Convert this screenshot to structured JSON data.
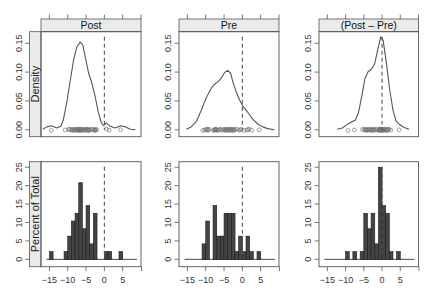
{
  "figure": {
    "width": 431,
    "height": 295,
    "colors": {
      "curve": "#555555",
      "rug": "#777777",
      "bar_fill": "#454545",
      "bar_stroke": "#1a1a1a",
      "strip_bg": "#ebebeb",
      "frame": "#555555",
      "reference_line": "#555555"
    },
    "columns": [
      {
        "x0": 41,
        "x1": 141,
        "zero_px": 104
      },
      {
        "x0": 179,
        "x1": 279,
        "zero_px": 242.5
      },
      {
        "x0": 319,
        "x1": 418.5,
        "zero_px": 382
      }
    ],
    "rows": {
      "density": {
        "strip_y0": 19,
        "y0": 31.7,
        "y1": 136.7
      },
      "histogram": {
        "y0": 161.7,
        "y1": 266.7
      }
    },
    "row_strips": {
      "density": "Density",
      "histogram": "Percent of Total"
    }
  },
  "chart_data": [
    {
      "type": "line",
      "panel": "Post",
      "row": "density",
      "title": "Post",
      "ylabel": "Density",
      "xlim": [
        -17.3,
        10.0
      ],
      "ylim": [
        -0.012,
        0.17
      ],
      "xticks": [
        -15,
        -10,
        -5,
        0,
        5,
        10
      ],
      "xtick_labels": [],
      "yticks": [
        0.0,
        0.05,
        0.1,
        0.15
      ],
      "ytick_labels": [
        "0.00",
        "0.05",
        "0.10",
        "0.15"
      ],
      "reference_line_x": 0,
      "grid": false,
      "curve": {
        "x": [
          -16.8,
          -15.7,
          -14.4,
          -13.0,
          -11.9,
          -11.2,
          -10.3,
          -9.3,
          -8.4,
          -7.5,
          -6.6,
          -5.9,
          -5.2,
          -4.3,
          -3.4,
          -2.5,
          -1.6,
          -0.8,
          -0.2,
          0.5,
          1.6,
          3.0,
          4.4,
          5.8,
          7.1,
          8.5
        ],
        "y": [
          0.001,
          0.005,
          0.007,
          0.003,
          0.006,
          0.017,
          0.046,
          0.086,
          0.121,
          0.144,
          0.152,
          0.147,
          0.126,
          0.098,
          0.081,
          0.057,
          0.029,
          0.012,
          0.007,
          0.012,
          0.006,
          0.003,
          0.007,
          0.005,
          0.001,
          0.0
        ]
      },
      "points": [
        -14.5,
        -10.7,
        -9.8,
        -9.5,
        -9.2,
        -8.9,
        -8.7,
        -8.5,
        -8.3,
        -8.1,
        -7.9,
        -7.7,
        -7.5,
        -7.4,
        -7.2,
        -7.1,
        -6.95,
        -6.9,
        -6.8,
        -6.7,
        -6.6,
        -6.5,
        -6.4,
        -6.3,
        -6.2,
        -6.1,
        -5.8,
        -5.6,
        -5.4,
        -5.2,
        -4.9,
        -4.8,
        -4.6,
        -4.5,
        -4.3,
        -4.2,
        -4.1,
        -3.7,
        -3.3,
        -2.9,
        -2.8,
        -2.6,
        -2.5,
        -2.3,
        -2.1,
        0.6,
        1.3,
        4.4
      ]
    },
    {
      "type": "line",
      "panel": "Pre",
      "row": "density",
      "title": "Pre",
      "ylabel": "",
      "xlim": [
        -17.3,
        10.0
      ],
      "ylim": [
        -0.012,
        0.17
      ],
      "xticks": [
        -15,
        -10,
        -5,
        0,
        5,
        10
      ],
      "xtick_labels": [],
      "yticks": [
        0.0,
        0.05,
        0.1,
        0.15
      ],
      "ytick_labels": [
        "0.00",
        "0.05",
        "0.10",
        "0.15"
      ],
      "reference_line_x": 0,
      "grid": false,
      "curve": {
        "x": [
          -15.3,
          -14.0,
          -12.6,
          -11.2,
          -9.9,
          -8.5,
          -7.6,
          -6.7,
          -5.8,
          -4.9,
          -4.0,
          -3.2,
          -2.6,
          -1.7,
          -0.8,
          0.1,
          1.5,
          2.9,
          4.2,
          5.6,
          6.9,
          8.8
        ],
        "y": [
          0.001,
          0.005,
          0.014,
          0.034,
          0.055,
          0.072,
          0.079,
          0.083,
          0.089,
          0.099,
          0.103,
          0.098,
          0.083,
          0.066,
          0.052,
          0.041,
          0.03,
          0.018,
          0.01,
          0.005,
          0.002,
          0.0
        ]
      },
      "points": [
        -10.8,
        -10.3,
        -9.9,
        -9.7,
        -9.5,
        -9.3,
        -9.1,
        -7.9,
        -7.7,
        -7.5,
        -7.4,
        -7.3,
        -7.2,
        -7.1,
        -6.8,
        -6.5,
        -6.2,
        -5.9,
        -5.5,
        -5.1,
        -4.9,
        -4.7,
        -4.5,
        -4.4,
        -4.2,
        -4.1,
        -3.9,
        -3.7,
        -3.5,
        -3.4,
        -3.2,
        -3.1,
        -2.9,
        -2.7,
        -2.5,
        -2.4,
        -2.2,
        -2.1,
        -1.5,
        -0.9,
        -0.6,
        -0.3,
        0.4,
        1.2,
        1.5,
        1.8,
        2.5,
        4.6
      ]
    },
    {
      "type": "line",
      "panel": "(Post - Pre)",
      "row": "density",
      "title": "(Post – Pre)",
      "ylabel": "",
      "xlim": [
        -17.3,
        10.0
      ],
      "ylim": [
        -0.012,
        0.17
      ],
      "xticks": [
        -15,
        -10,
        -5,
        0,
        5,
        10
      ],
      "xtick_labels": [],
      "yticks": [
        0.0,
        0.05,
        0.1,
        0.15
      ],
      "ytick_labels": [
        "0.00",
        "0.05",
        "0.10",
        "0.15"
      ],
      "reference_line_x": 0,
      "grid": false,
      "curve": {
        "x": [
          -12.3,
          -10.9,
          -9.6,
          -8.2,
          -7.3,
          -6.5,
          -5.6,
          -4.7,
          -3.8,
          -2.9,
          -2.0,
          -1.1,
          -0.35,
          0.3,
          1.2,
          2.1,
          3.0,
          3.8,
          4.8,
          6.1,
          7.4
        ],
        "y": [
          0.001,
          0.003,
          0.009,
          0.014,
          0.017,
          0.029,
          0.057,
          0.089,
          0.101,
          0.105,
          0.115,
          0.141,
          0.161,
          0.155,
          0.115,
          0.069,
          0.034,
          0.016,
          0.009,
          0.004,
          0.001
        ]
      },
      "points": [
        -9.3,
        -7.6,
        -5.4,
        -4.9,
        -4.7,
        -4.5,
        -4.3,
        -4.2,
        -4.05,
        -3.8,
        -3.5,
        -3.3,
        -3.1,
        -2.9,
        -2.7,
        -2.5,
        -2.3,
        -2.2,
        -2.05,
        -1.7,
        -1.3,
        -0.95,
        -0.9,
        -0.8,
        -0.7,
        -0.6,
        -0.5,
        -0.45,
        -0.4,
        -0.3,
        -0.25,
        -0.2,
        -0.1,
        0.1,
        0.2,
        0.3,
        0.4,
        0.5,
        0.7,
        0.9,
        1.1,
        1.2,
        1.4,
        1.5,
        1.7,
        1.9,
        2.4,
        4.7
      ]
    },
    {
      "type": "bar",
      "panel": "Post",
      "row": "histogram",
      "ylabel": "Percent of Total",
      "xlim": [
        -17.3,
        10.0
      ],
      "ylim": [
        -2.0,
        26.5
      ],
      "xticks": [
        -15,
        -10,
        -5,
        0,
        5
      ],
      "xtick_labels": [
        "−15",
        "−10",
        "−5",
        "0",
        "5"
      ],
      "yticks": [
        0,
        5,
        10,
        15,
        20,
        25
      ],
      "ytick_labels": [
        "0",
        "5",
        "10",
        "15",
        "20",
        "25"
      ],
      "reference_line_x": 0,
      "baseline_range": [
        -15.8,
        8.9
      ],
      "bins": [
        {
          "x0": -15,
          "x1": -14,
          "pct": 2.1
        },
        {
          "x0": -11,
          "x1": -10,
          "pct": 2.1
        },
        {
          "x0": -10,
          "x1": -9,
          "pct": 6.3
        },
        {
          "x0": -9,
          "x1": -8,
          "pct": 10.4
        },
        {
          "x0": -8,
          "x1": -7,
          "pct": 12.5
        },
        {
          "x0": -7,
          "x1": -6,
          "pct": 20.8
        },
        {
          "x0": -6,
          "x1": -5,
          "pct": 8.3
        },
        {
          "x0": -5,
          "x1": -4,
          "pct": 14.6
        },
        {
          "x0": -4,
          "x1": -3,
          "pct": 4.2
        },
        {
          "x0": -3,
          "x1": -2,
          "pct": 12.5
        },
        {
          "x0": 0,
          "x1": 1,
          "pct": 2.1
        },
        {
          "x0": 1,
          "x1": 2,
          "pct": 2.1
        },
        {
          "x0": 4,
          "x1": 5,
          "pct": 2.1
        }
      ]
    },
    {
      "type": "bar",
      "panel": "Pre",
      "row": "histogram",
      "ylabel": "",
      "xlim": [
        -17.3,
        10.0
      ],
      "ylim": [
        -2.0,
        26.5
      ],
      "xticks": [
        -15,
        -10,
        -5,
        0,
        5
      ],
      "xtick_labels": [
        "−15",
        "−10",
        "−5",
        "0",
        "5"
      ],
      "yticks": [
        0,
        5,
        10,
        15,
        20,
        25
      ],
      "ytick_labels": [
        "0",
        "5",
        "10",
        "15",
        "20",
        "25"
      ],
      "reference_line_x": 0,
      "baseline_range": [
        -15.8,
        8.9
      ],
      "bins": [
        {
          "x0": -11,
          "x1": -10,
          "pct": 4.2
        },
        {
          "x0": -10,
          "x1": -9,
          "pct": 10.4
        },
        {
          "x0": -8,
          "x1": -7,
          "pct": 14.6
        },
        {
          "x0": -7,
          "x1": -6,
          "pct": 6.3
        },
        {
          "x0": -6,
          "x1": -5,
          "pct": 6.3
        },
        {
          "x0": -5,
          "x1": -4,
          "pct": 12.5
        },
        {
          "x0": -4,
          "x1": -3,
          "pct": 12.5
        },
        {
          "x0": -3,
          "x1": -2,
          "pct": 12.5
        },
        {
          "x0": -2,
          "x1": -1,
          "pct": 2.1
        },
        {
          "x0": -1,
          "x1": 0,
          "pct": 6.3
        },
        {
          "x0": 0,
          "x1": 1,
          "pct": 2.1
        },
        {
          "x0": 1,
          "x1": 2,
          "pct": 6.3
        },
        {
          "x0": 2,
          "x1": 3,
          "pct": 2.1
        },
        {
          "x0": 4,
          "x1": 5,
          "pct": 2.1
        }
      ]
    },
    {
      "type": "bar",
      "panel": "(Post - Pre)",
      "row": "histogram",
      "ylabel": "",
      "xlim": [
        -17.3,
        10.0
      ],
      "ylim": [
        -2.0,
        26.5
      ],
      "xticks": [
        -15,
        -10,
        -5,
        0,
        5
      ],
      "xtick_labels": [
        "−15",
        "−10",
        "−5",
        "0",
        "5"
      ],
      "yticks": [
        0,
        5,
        10,
        15,
        20,
        25
      ],
      "ytick_labels": [
        "0",
        "5",
        "10",
        "15",
        "20",
        "25"
      ],
      "reference_line_x": 0,
      "baseline_range": [
        -15.8,
        8.9
      ],
      "bins": [
        {
          "x0": -10,
          "x1": -9,
          "pct": 2.1
        },
        {
          "x0": -8,
          "x1": -7,
          "pct": 2.1
        },
        {
          "x0": -6,
          "x1": -5,
          "pct": 2.1
        },
        {
          "x0": -5,
          "x1": -4,
          "pct": 12.5
        },
        {
          "x0": -4,
          "x1": -3,
          "pct": 8.3
        },
        {
          "x0": -3,
          "x1": -2,
          "pct": 12.5
        },
        {
          "x0": -2,
          "x1": -1,
          "pct": 4.2
        },
        {
          "x0": -1,
          "x1": 0,
          "pct": 25.0
        },
        {
          "x0": 0,
          "x1": 1,
          "pct": 14.6
        },
        {
          "x0": 1,
          "x1": 2,
          "pct": 12.5
        },
        {
          "x0": 2,
          "x1": 3,
          "pct": 2.1
        },
        {
          "x0": 4,
          "x1": 5,
          "pct": 2.1
        }
      ]
    }
  ]
}
